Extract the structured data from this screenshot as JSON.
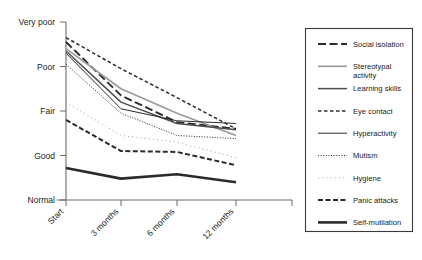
{
  "chart_data": {
    "type": "line",
    "title": "",
    "xlabel": "",
    "ylabel": "",
    "grid": false,
    "legend_position": "right",
    "x": [
      "Start",
      "3 months",
      "6 months",
      "12 months"
    ],
    "categories": [
      "Start",
      "3 months",
      "6 months",
      "12 months"
    ],
    "y_tick_labels": [
      "Very poor",
      "Poor",
      "Fair",
      "Good",
      "Normal"
    ],
    "y_tick_values": [
      5,
      4,
      3,
      2,
      1
    ],
    "ylim": [
      1,
      5
    ],
    "y_scale_note": "Ordinal severity scale from Normal (best) to Very poor (worst)",
    "series": [
      {
        "name": "Social isolation",
        "style": "long-dash",
        "values": [
          4.55,
          3.35,
          2.75,
          2.6
        ]
      },
      {
        "name": "Stereotypal activity",
        "style": "thin-solid-light",
        "values": [
          4.4,
          3.5,
          2.95,
          2.45
        ]
      },
      {
        "name": "Learning skills",
        "style": "medium-solid",
        "values": [
          4.35,
          3.2,
          2.72,
          2.58
        ]
      },
      {
        "name": "Eye contact",
        "style": "short-dash",
        "values": [
          4.65,
          3.95,
          3.3,
          2.6
        ]
      },
      {
        "name": "Hyperactivity",
        "style": "thin-solid",
        "values": [
          4.3,
          3.05,
          2.78,
          2.72
        ]
      },
      {
        "name": "Mutism",
        "style": "fine-dot",
        "values": [
          4.05,
          2.95,
          2.45,
          2.38
        ]
      },
      {
        "name": "Hygiene",
        "style": "sparse-dot",
        "values": [
          3.2,
          2.45,
          2.3,
          1.95
        ]
      },
      {
        "name": "Panic attacks",
        "style": "dash",
        "values": [
          2.8,
          2.1,
          2.08,
          1.78
        ]
      },
      {
        "name": "Self-mutilation",
        "style": "thick-solid",
        "values": [
          1.72,
          1.48,
          1.58,
          1.4
        ]
      }
    ]
  },
  "legend": {
    "items": [
      {
        "label": "Social isolation"
      },
      {
        "label": "Stereotypal activity"
      },
      {
        "label": "Learning skills"
      },
      {
        "label": "Eye contact"
      },
      {
        "label": "Hyperactivity"
      },
      {
        "label": "Mutism"
      },
      {
        "label": "Hygiene"
      },
      {
        "label": "Panic attacks"
      },
      {
        "label": "Self-mutilation"
      }
    ]
  },
  "axes": {
    "y_labels": [
      "Very poor",
      "Poor",
      "Fair",
      "Good",
      "Normal"
    ],
    "x_labels": [
      "Start",
      "3 months",
      "6 months",
      "12 months"
    ]
  },
  "colors": {
    "axis": "#6b6b6b",
    "text": "#1a1a1a",
    "line_dark": "#2b2b2b",
    "line_mid": "#4d4d4d",
    "line_light": "#9a9a9a",
    "legend_border": "#3a3a3a",
    "background": "#ffffff"
  }
}
